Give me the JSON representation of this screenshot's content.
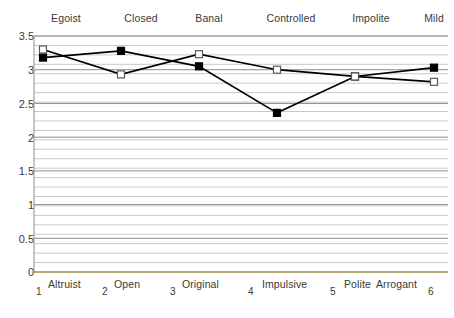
{
  "chart_data": {
    "type": "line",
    "title": "",
    "subtitle": "",
    "xlabel": "",
    "ylabel": "",
    "ylim": [
      0,
      3.5
    ],
    "yticks": [
      0,
      0.5,
      1,
      1.5,
      2,
      2.5,
      3,
      3.5
    ],
    "ytick_labels": [
      "0",
      "0.5",
      "1",
      "1.5",
      "2",
      "2.5",
      "3",
      "3.5"
    ],
    "x": [
      1,
      2,
      3,
      4,
      5,
      6
    ],
    "xtick_labels": [
      "1",
      "2",
      "3",
      "4",
      "5",
      "6"
    ],
    "grid": true,
    "grid_minor": true,
    "legend": "none",
    "pole_labels_top": [
      "Egoist",
      "Closed",
      "Banal",
      "Controlled",
      "Impolite",
      "Mild"
    ],
    "pole_labels_bottom": [
      "Altruist",
      "Open",
      "Original",
      "Impulsive",
      "Polite",
      "Arrogant"
    ],
    "series": [
      {
        "name": "series-filled",
        "marker": "filled-square",
        "color": "#000000",
        "values": [
          3.18,
          3.28,
          3.05,
          2.36,
          2.9,
          3.03
        ]
      },
      {
        "name": "series-open",
        "marker": "open-square",
        "color": "#000000",
        "values": [
          3.3,
          2.93,
          3.23,
          3.0,
          2.9,
          2.82
        ]
      }
    ],
    "colors": {
      "line": "#000000",
      "grid_major": "#8c8c8c",
      "grid_minor": "#c9c9c9",
      "axis": "#b0a36a",
      "text": "#3a3a3a",
      "background": "#ffffff"
    }
  },
  "top_labels": [
    {
      "text": "Egoist",
      "x": 66
    },
    {
      "text": "Closed",
      "x": 141
    },
    {
      "text": "Banal",
      "x": 209
    },
    {
      "text": "Controlled",
      "x": 291
    },
    {
      "text": "Impolite",
      "x": 371
    },
    {
      "text": "Mild",
      "x": 434
    }
  ],
  "bottom_numbers": [
    {
      "text": "1",
      "x": 36
    },
    {
      "text": "2",
      "x": 102
    },
    {
      "text": "3",
      "x": 170
    },
    {
      "text": "4",
      "x": 248
    },
    {
      "text": "5",
      "x": 330
    },
    {
      "text": "6",
      "x": 428
    }
  ],
  "bottom_categories": [
    {
      "text": "Altruist",
      "x": 48
    },
    {
      "text": "Open",
      "x": 114
    },
    {
      "text": "Original",
      "x": 182
    },
    {
      "text": "Impulsive",
      "x": 262
    },
    {
      "text": "Polite",
      "x": 344
    },
    {
      "text": "Arrogant",
      "x": 376
    }
  ],
  "y_axis": [
    {
      "text": "3.5",
      "y": 36
    },
    {
      "text": "3",
      "y": 70
    },
    {
      "text": "2.5",
      "y": 104
    },
    {
      "text": "2",
      "y": 138
    },
    {
      "text": "1.5",
      "y": 171
    },
    {
      "text": "1",
      "y": 205
    },
    {
      "text": "0.5",
      "y": 239
    },
    {
      "text": "0",
      "y": 272
    }
  ]
}
